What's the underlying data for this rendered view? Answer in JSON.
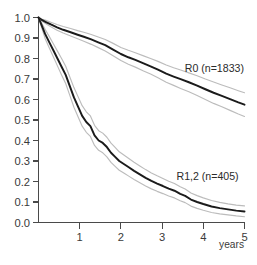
{
  "chart_data": {
    "type": "line",
    "title": "",
    "subtitle": "",
    "xlabel": "years",
    "ylabel": "",
    "xlim": [
      0,
      5
    ],
    "ylim": [
      0,
      1.0
    ],
    "grid": false,
    "legend_position": "inline-right",
    "x_ticks": [
      0,
      1,
      2,
      3,
      4,
      5
    ],
    "x_tick_labels": [
      "",
      "1",
      "2",
      "3",
      "4",
      "5"
    ],
    "y_ticks": [
      0.0,
      0.1,
      0.2,
      0.3,
      0.4,
      0.5,
      0.6,
      0.7,
      0.8,
      0.9,
      1.0
    ],
    "y_tick_labels": [
      "0.0",
      "0.1",
      "0.2",
      "0.3",
      "0.4",
      "0.5",
      "0.6",
      "0.7",
      "0.8",
      "0.9",
      "1.0"
    ],
    "annotations": [
      {
        "text": "R0 (n=1833)",
        "x": 3.55,
        "y": 0.735
      },
      {
        "text": "R1,2 (n=405)",
        "x": 3.35,
        "y": 0.205
      }
    ],
    "series": [
      {
        "name": "R0 (n=1833)",
        "label": "R0 (n=1833)",
        "n": 1833,
        "color": "#1b1b1b",
        "ci_color": "#bcbcbc",
        "x": [
          0.0,
          0.08,
          0.18,
          0.3,
          0.45,
          0.6,
          0.78,
          0.95,
          1.1,
          1.28,
          1.45,
          1.62,
          1.8,
          2.0,
          2.18,
          2.35,
          2.55,
          2.72,
          2.9,
          3.1,
          3.28,
          3.45,
          3.65,
          3.85,
          4.05,
          4.25,
          4.45,
          4.65,
          4.85,
          5.0
        ],
        "values": [
          1.0,
          0.988,
          0.978,
          0.966,
          0.952,
          0.94,
          0.928,
          0.916,
          0.906,
          0.893,
          0.879,
          0.865,
          0.845,
          0.822,
          0.806,
          0.793,
          0.776,
          0.762,
          0.746,
          0.726,
          0.712,
          0.699,
          0.684,
          0.668,
          0.65,
          0.633,
          0.618,
          0.602,
          0.586,
          0.575
        ],
        "ci_upper": [
          1.0,
          0.993,
          0.986,
          0.977,
          0.966,
          0.956,
          0.946,
          0.936,
          0.928,
          0.917,
          0.905,
          0.893,
          0.875,
          0.854,
          0.84,
          0.828,
          0.813,
          0.8,
          0.786,
          0.768,
          0.755,
          0.744,
          0.73,
          0.716,
          0.7,
          0.685,
          0.671,
          0.657,
          0.643,
          0.633
        ],
        "ci_lower": [
          1.0,
          0.983,
          0.97,
          0.955,
          0.938,
          0.924,
          0.91,
          0.896,
          0.884,
          0.869,
          0.853,
          0.837,
          0.815,
          0.79,
          0.772,
          0.758,
          0.739,
          0.724,
          0.706,
          0.684,
          0.669,
          0.654,
          0.638,
          0.62,
          0.6,
          0.581,
          0.565,
          0.547,
          0.529,
          0.517
        ]
      },
      {
        "name": "R1,2 (n=405)",
        "label": "R1,2 (n=405)",
        "n": 405,
        "color": "#1b1b1b",
        "ci_color": "#bcbcbc",
        "x": [
          0.0,
          0.08,
          0.16,
          0.26,
          0.36,
          0.46,
          0.56,
          0.66,
          0.76,
          0.86,
          0.96,
          1.06,
          1.16,
          1.26,
          1.36,
          1.46,
          1.56,
          1.66,
          1.76,
          1.86,
          1.96,
          2.08,
          2.2,
          2.32,
          2.46,
          2.6,
          2.74,
          2.88,
          3.02,
          3.16,
          3.3,
          3.44,
          3.56,
          3.7,
          3.85,
          4.0,
          4.2,
          4.4,
          4.6,
          4.8,
          5.0
        ],
        "values": [
          1.0,
          0.96,
          0.92,
          0.88,
          0.84,
          0.8,
          0.76,
          0.72,
          0.665,
          0.61,
          0.565,
          0.52,
          0.49,
          0.47,
          0.425,
          0.4,
          0.388,
          0.368,
          0.34,
          0.32,
          0.3,
          0.284,
          0.268,
          0.252,
          0.235,
          0.218,
          0.203,
          0.19,
          0.178,
          0.165,
          0.155,
          0.14,
          0.13,
          0.112,
          0.1,
          0.09,
          0.078,
          0.07,
          0.064,
          0.058,
          0.054
        ],
        "ci_upper": [
          1.0,
          0.972,
          0.942,
          0.908,
          0.872,
          0.836,
          0.8,
          0.762,
          0.71,
          0.658,
          0.614,
          0.57,
          0.54,
          0.52,
          0.474,
          0.448,
          0.436,
          0.416,
          0.387,
          0.366,
          0.345,
          0.328,
          0.311,
          0.294,
          0.276,
          0.258,
          0.242,
          0.228,
          0.215,
          0.201,
          0.19,
          0.174,
          0.163,
          0.144,
          0.131,
          0.12,
          0.107,
          0.098,
          0.091,
          0.085,
          0.081
        ],
        "ci_lower": [
          1.0,
          0.948,
          0.898,
          0.852,
          0.808,
          0.764,
          0.72,
          0.678,
          0.62,
          0.562,
          0.516,
          0.47,
          0.44,
          0.42,
          0.376,
          0.352,
          0.34,
          0.32,
          0.293,
          0.274,
          0.255,
          0.24,
          0.225,
          0.21,
          0.194,
          0.178,
          0.164,
          0.152,
          0.141,
          0.129,
          0.12,
          0.106,
          0.097,
          0.08,
          0.069,
          0.06,
          0.049,
          0.042,
          0.037,
          0.032,
          0.028
        ]
      }
    ]
  },
  "figure": {
    "background_color": "#ffffff",
    "axis_color": "#4a4a4a"
  }
}
